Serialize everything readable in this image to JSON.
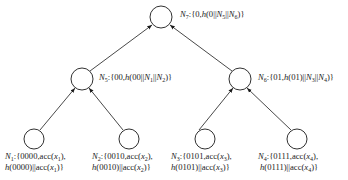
{
  "diagram": {
    "type": "merkle-tree",
    "nodes": [
      {
        "id": "N7",
        "name": "N",
        "sub": "7",
        "text": ":{0,h(0||N5||N6)}",
        "parts": [
          "{0,",
          "h",
          "(0||",
          "N",
          "5",
          "||",
          "N",
          "6",
          ")}"
        ],
        "cx": 161,
        "cy": 17
      },
      {
        "id": "N5",
        "name": "N",
        "sub": "5",
        "parts": [
          "{00,",
          "h",
          "(00||",
          "N",
          "1",
          "||",
          "N",
          "2",
          ")}"
        ],
        "cx": 82,
        "cy": 79
      },
      {
        "id": "N6",
        "name": "N",
        "sub": "6",
        "parts": [
          "{01,",
          "h",
          "(01)||",
          "N",
          "3",
          "||",
          "N",
          "4",
          ")}"
        ],
        "cx": 240,
        "cy": 79
      },
      {
        "id": "N1",
        "name": "N",
        "sub": "1",
        "line1": [
          "{0000,acc(",
          "x",
          "1",
          "),"
        ],
        "line2": [
          "h",
          "(0000)||acc(",
          "x",
          "1",
          ")}"
        ],
        "cx": 34,
        "cy": 139
      },
      {
        "id": "N2",
        "name": "N",
        "sub": "2",
        "line1": [
          "{0010,acc(",
          "x",
          "2",
          "),"
        ],
        "line2": [
          "h",
          "(0010)||acc(",
          "x",
          "2",
          ")}"
        ],
        "cx": 129,
        "cy": 139
      },
      {
        "id": "N3",
        "name": "N",
        "sub": "3",
        "line1": [
          "{0101,acc(",
          "x",
          "3",
          "),"
        ],
        "line2": [
          "h",
          "(0101)||acc(",
          "x",
          "3",
          ")}"
        ],
        "cx": 205,
        "cy": 139
      },
      {
        "id": "N4",
        "name": "N",
        "sub": "4",
        "line1": [
          "{0111,acc(",
          "x",
          "4",
          "),"
        ],
        "line2": [
          "h",
          "(0111)||acc(",
          "x",
          "4",
          ")}"
        ],
        "cx": 297,
        "cy": 139
      }
    ],
    "edges": [
      {
        "from": "N5",
        "to": "N7"
      },
      {
        "from": "N6",
        "to": "N7"
      },
      {
        "from": "N1",
        "to": "N5"
      },
      {
        "from": "N2",
        "to": "N5"
      },
      {
        "from": "N3",
        "to": "N6"
      },
      {
        "from": "N4",
        "to": "N6"
      }
    ],
    "colors": {
      "stroke": "#1a1a1a",
      "background": "#ffffff"
    }
  }
}
